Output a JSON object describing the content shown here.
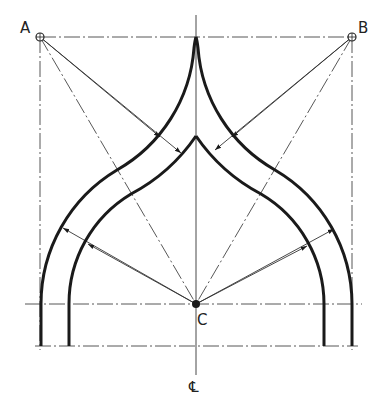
{
  "figure": {
    "type": "technical-drawing",
    "labels": {
      "point_a": "A",
      "point_b": "B",
      "point_c": "C",
      "centerline": "℄"
    },
    "colors": {
      "line": "#1a1a1a",
      "background": "#ffffff"
    }
  }
}
